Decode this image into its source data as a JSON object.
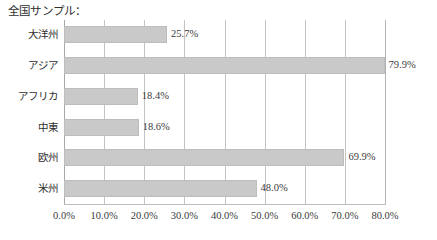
{
  "chart_data": {
    "type": "bar",
    "orientation": "horizontal",
    "title": "全国サンプル：",
    "xlabel": "",
    "ylabel": "",
    "categories": [
      "大洋州",
      "アジア",
      "アフリカ",
      "中東",
      "欧州",
      "米州"
    ],
    "values": [
      25.7,
      79.9,
      18.4,
      18.6,
      69.9,
      48.0
    ],
    "data_labels": [
      "25.7%",
      "79.9%",
      "18.4%",
      "18.6%",
      "69.9%",
      "48.0%"
    ],
    "xlim": [
      0,
      80
    ],
    "xticks": [
      0,
      10,
      20,
      30,
      40,
      50,
      60,
      70,
      80
    ],
    "xtick_labels": [
      "0.0%",
      "10.0%",
      "20.0%",
      "30.0%",
      "40.0%",
      "50.0%",
      "60.0%",
      "70.0%",
      "80.0%"
    ],
    "grid": "vertical",
    "legend": "none",
    "bar_color": "#c9c9c9",
    "bar_border_color": "#bdbdbd",
    "gridline_color": "#c4c4c4",
    "background": "#ffffff",
    "text_color": "#3a3a3a"
  }
}
